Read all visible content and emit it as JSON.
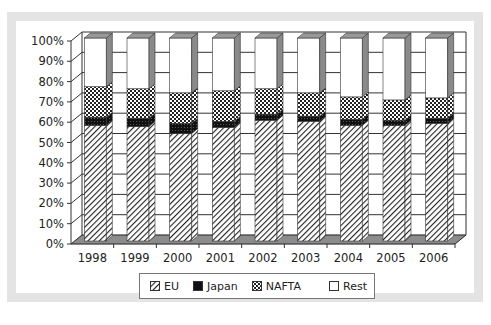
{
  "chart_data": {
    "type": "bar",
    "stacked": true,
    "percent_stacked": true,
    "three_d": true,
    "title": "",
    "xlabel": "",
    "ylabel": "",
    "categories": [
      "1998",
      "1999",
      "2000",
      "2001",
      "2002",
      "2003",
      "2004",
      "2005",
      "2006"
    ],
    "series": [
      {
        "name": "EU",
        "pattern": "diagonal-hatch",
        "values": [
          57,
          56.5,
          53,
          56,
          59.5,
          59,
          57,
          57,
          58
        ]
      },
      {
        "name": "Japan",
        "pattern": "solid-dark",
        "values": [
          4,
          4,
          5,
          3,
          3,
          2.5,
          3,
          2.5,
          2.5
        ]
      },
      {
        "name": "NAFTA",
        "pattern": "dotted",
        "values": [
          15,
          14.5,
          15,
          15,
          12.5,
          11.5,
          11,
          10,
          10
        ]
      },
      {
        "name": "Rest",
        "pattern": "white",
        "values": [
          24,
          25,
          27,
          26,
          25,
          27,
          29,
          30.5,
          29.5
        ]
      }
    ],
    "yticks": [
      "0%",
      "10%",
      "20%",
      "30%",
      "40%",
      "50%",
      "60%",
      "70%",
      "80%",
      "90%",
      "100%"
    ],
    "ylim": [
      0,
      100
    ],
    "grid": true,
    "legend_position": "bottom"
  },
  "legend": {
    "items": [
      {
        "label": "EU"
      },
      {
        "label": "Japan"
      },
      {
        "label": "NAFTA"
      },
      {
        "label": "Rest"
      }
    ]
  }
}
